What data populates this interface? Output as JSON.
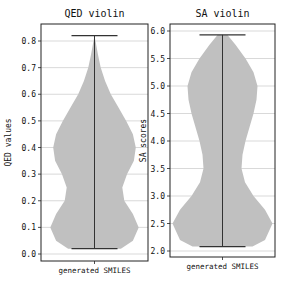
{
  "chart_data": [
    {
      "type": "violin",
      "title": "QED violin",
      "xlabel": "",
      "ylabel": "QED values",
      "categories": [
        "generated SMILES"
      ],
      "ylim": [
        -0.01,
        0.86
      ],
      "yticks": [
        "0.0",
        "0.1",
        "0.2",
        "0.3",
        "0.4",
        "0.5",
        "0.6",
        "0.7",
        "0.8"
      ],
      "grid": "horizontal",
      "min": 0.02,
      "max": 0.82,
      "density_profile": [
        {
          "y": 0.02,
          "w": 0.55
        },
        {
          "y": 0.05,
          "w": 0.8
        },
        {
          "y": 0.1,
          "w": 0.92
        },
        {
          "y": 0.15,
          "w": 0.8
        },
        {
          "y": 0.2,
          "w": 0.62
        },
        {
          "y": 0.25,
          "w": 0.58
        },
        {
          "y": 0.3,
          "w": 0.68
        },
        {
          "y": 0.35,
          "w": 0.82
        },
        {
          "y": 0.4,
          "w": 0.86
        },
        {
          "y": 0.45,
          "w": 0.8
        },
        {
          "y": 0.5,
          "w": 0.66
        },
        {
          "y": 0.55,
          "w": 0.5
        },
        {
          "y": 0.6,
          "w": 0.34
        },
        {
          "y": 0.65,
          "w": 0.22
        },
        {
          "y": 0.7,
          "w": 0.13
        },
        {
          "y": 0.75,
          "w": 0.07
        },
        {
          "y": 0.8,
          "w": 0.02
        },
        {
          "y": 0.82,
          "w": 0.0
        }
      ]
    },
    {
      "type": "violin",
      "title": "SA violin",
      "xlabel": "",
      "ylabel": "SA scores",
      "categories": [
        "generated SMILES"
      ],
      "ylim": [
        1.9,
        6.05
      ],
      "yticks": [
        "2.0",
        "2.5",
        "3.0",
        "3.5",
        "4.0",
        "4.5",
        "5.0",
        "5.5",
        "6.0"
      ],
      "grid": "horizontal",
      "min": 2.08,
      "max": 5.93,
      "density_profile": [
        {
          "y": 2.08,
          "w": 0.6
        },
        {
          "y": 2.2,
          "w": 0.85
        },
        {
          "y": 2.5,
          "w": 1.0
        },
        {
          "y": 2.75,
          "w": 0.85
        },
        {
          "y": 3.0,
          "w": 0.62
        },
        {
          "y": 3.25,
          "w": 0.45
        },
        {
          "y": 3.5,
          "w": 0.38
        },
        {
          "y": 3.75,
          "w": 0.4
        },
        {
          "y": 4.0,
          "w": 0.46
        },
        {
          "y": 4.25,
          "w": 0.54
        },
        {
          "y": 4.5,
          "w": 0.62
        },
        {
          "y": 4.75,
          "w": 0.68
        },
        {
          "y": 5.0,
          "w": 0.7
        },
        {
          "y": 5.25,
          "w": 0.62
        },
        {
          "y": 5.5,
          "w": 0.46
        },
        {
          "y": 5.75,
          "w": 0.26
        },
        {
          "y": 5.93,
          "w": 0.1
        }
      ]
    }
  ],
  "style": {
    "violin_fill": "#c0c0c0",
    "line_color": "#333333",
    "grid_color": "#cfcfcf",
    "axis_color": "#222222"
  }
}
